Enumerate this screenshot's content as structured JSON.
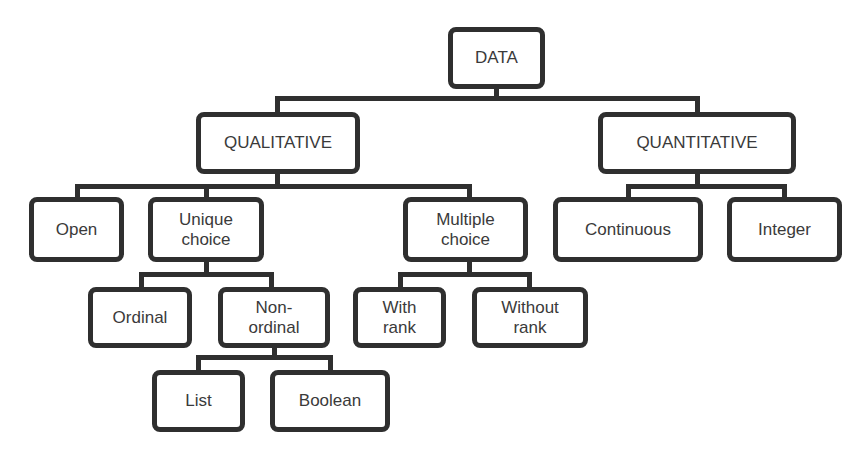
{
  "diagram": {
    "colors": {
      "stroke": "#2f2f2f",
      "text": "#3a3a3a",
      "background": "#ffffff"
    },
    "nodes": {
      "data": {
        "label": "DATA",
        "box": [
          448,
          27,
          97,
          62
        ]
      },
      "qualitative": {
        "label": "QUALITATIVE",
        "box": [
          196,
          112,
          164,
          62
        ]
      },
      "quantitative": {
        "label": "QUANTITATIVE",
        "box": [
          598,
          112,
          198,
          62
        ]
      },
      "open": {
        "label": "Open",
        "box": [
          29,
          197,
          95,
          65
        ]
      },
      "unique_choice": {
        "label": "Unique\nchoice",
        "box": [
          148,
          197,
          116,
          65
        ]
      },
      "multiple_choice": {
        "label": "Multiple\nchoice",
        "box": [
          403,
          197,
          125,
          65
        ]
      },
      "continuous": {
        "label": "Continuous",
        "box": [
          553,
          197,
          150,
          65
        ]
      },
      "integer": {
        "label": "Integer",
        "box": [
          727,
          197,
          115,
          65
        ]
      },
      "ordinal": {
        "label": "Ordinal",
        "box": [
          88,
          287,
          104,
          61
        ]
      },
      "non_ordinal": {
        "label": "Non-\nordinal",
        "box": [
          218,
          287,
          112,
          61
        ]
      },
      "with_rank": {
        "label": "With\nrank",
        "box": [
          353,
          287,
          93,
          61
        ]
      },
      "without_rank": {
        "label": "Without\nrank",
        "box": [
          472,
          287,
          116,
          61
        ]
      },
      "list": {
        "label": "List",
        "box": [
          152,
          370,
          93,
          62
        ]
      },
      "boolean": {
        "label": "Boolean",
        "box": [
          270,
          370,
          120,
          62
        ]
      }
    },
    "edges": [
      [
        "data",
        "qualitative"
      ],
      [
        "data",
        "quantitative"
      ],
      [
        "qualitative",
        "open"
      ],
      [
        "qualitative",
        "unique_choice"
      ],
      [
        "qualitative",
        "multiple_choice"
      ],
      [
        "quantitative",
        "continuous"
      ],
      [
        "quantitative",
        "integer"
      ],
      [
        "unique_choice",
        "ordinal"
      ],
      [
        "unique_choice",
        "non_ordinal"
      ],
      [
        "multiple_choice",
        "with_rank"
      ],
      [
        "multiple_choice",
        "without_rank"
      ],
      [
        "non_ordinal",
        "list"
      ],
      [
        "non_ordinal",
        "boolean"
      ]
    ]
  }
}
